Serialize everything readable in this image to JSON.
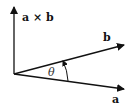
{
  "diagram": {
    "labels": {
      "cross": "a × b",
      "b": "b",
      "a": "a",
      "angle": "θ"
    }
  }
}
